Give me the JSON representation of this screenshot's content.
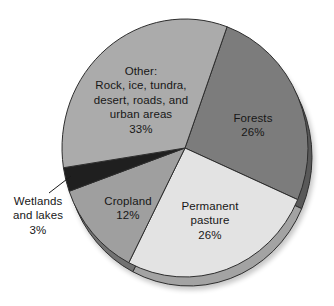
{
  "figure": {
    "kind": "textbook pie chart of global land use",
    "background_color": "#ffffff",
    "text_color": "#171717",
    "outline_color": "#2e2e2e"
  },
  "chart_data": {
    "type": "pie",
    "title": "",
    "effect": "3d-side-rim-with-shadow",
    "start_angle_deg_clockwise_from_12": 20,
    "total_percent": 100,
    "slices": [
      {
        "key": "forests",
        "category": "Forests",
        "percent": 26,
        "label": "Forests\n26%",
        "color": "#7c7c7c",
        "label_outside": false,
        "label_x": 253,
        "label_y": 125
      },
      {
        "key": "permanent-pasture",
        "category": "Permanent pasture",
        "percent": 26,
        "label": "Permanent\npasture\n26%",
        "color": "#e3e3e3",
        "label_outside": false,
        "label_x": 210,
        "label_y": 221
      },
      {
        "key": "cropland",
        "category": "Cropland",
        "percent": 12,
        "label": "Cropland\n12%",
        "color": "#9f9f9f",
        "label_outside": false,
        "label_x": 128,
        "label_y": 208
      },
      {
        "key": "wetlands-and-lakes",
        "category": "Wetlands and lakes",
        "percent": 3,
        "label": "Wetlands\nand lakes\n3%",
        "color": "#1f1f1f",
        "label_outside": true,
        "label_x": 38,
        "label_y": 216,
        "leader": [
          49,
          193,
          71,
          176
        ]
      },
      {
        "key": "other",
        "category": "Other: Rock, ice, tundra, desert, roads, and urban areas",
        "percent": 33,
        "label": "Other:\nRock, ice, tundra,\ndesert, roads, and\nurban areas\n33%",
        "color": "#ababab",
        "label_outside": false,
        "label_x": 141,
        "label_y": 100
      }
    ],
    "geometry": {
      "cx": 185,
      "cy": 148,
      "rx": 123,
      "ry": 129,
      "rim_dx": 4,
      "rim_dy": 9,
      "rim_shade": 0.72
    }
  }
}
